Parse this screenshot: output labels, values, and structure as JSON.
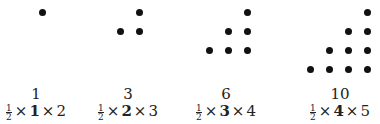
{
  "diagram": {
    "items": [
      {
        "value": "1",
        "half": [
          "1",
          "2"
        ],
        "n": "1",
        "n_plus_1": "2",
        "rows": 1
      },
      {
        "value": "3",
        "half": [
          "1",
          "2"
        ],
        "n": "2",
        "n_plus_1": "3",
        "rows": 2
      },
      {
        "value": "6",
        "half": [
          "1",
          "2"
        ],
        "n": "3",
        "n_plus_1": "4",
        "rows": 3
      },
      {
        "value": "10",
        "half": [
          "1",
          "2"
        ],
        "n": "4",
        "n_plus_1": "5",
        "rows": 4
      }
    ],
    "times_symbol": "×",
    "dot_color": "#111111"
  }
}
